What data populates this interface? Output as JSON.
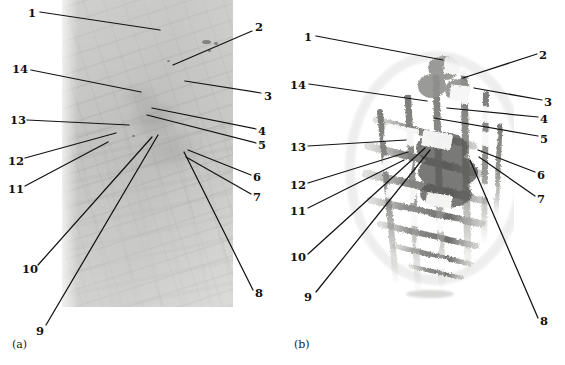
{
  "figure": {
    "type": "two-panel micrograph figure with numbered leader-line callouts",
    "background_color": "#ffffff",
    "ink_color": "#131313"
  },
  "panels": [
    {
      "id": "a",
      "caption": "(a)",
      "caption_pos": {
        "x": 12,
        "y": 338
      },
      "image": {
        "name": "micrograph-photo",
        "description": "grayscale light micrograph, rectangular frame",
        "bounds": {
          "x": 62,
          "y": 0,
          "w": 171,
          "h": 307
        },
        "base_color": "#c5c5c3",
        "white_notch": {
          "x": 200,
          "y": 228,
          "w": 28,
          "h": 20
        }
      },
      "labels": [
        {
          "text": "1",
          "x": 28,
          "y": 8,
          "anchor": "right",
          "line": {
            "x1": 40,
            "y1": 12,
            "x2": 160,
            "y2": 30
          }
        },
        {
          "text": "2",
          "x": 255,
          "y": 22,
          "anchor": "left",
          "line": {
            "x1": 252,
            "y1": 31,
            "x2": 173,
            "y2": 65
          }
        },
        {
          "text": "3",
          "x": 264,
          "y": 91,
          "anchor": "left",
          "line": {
            "x1": 261,
            "y1": 93,
            "x2": 185,
            "y2": 81
          }
        },
        {
          "text": "4",
          "x": 258,
          "y": 126,
          "anchor": "left",
          "line": {
            "x1": 256,
            "y1": 129,
            "x2": 152,
            "y2": 108
          }
        },
        {
          "text": "5",
          "x": 258,
          "y": 140,
          "anchor": "left",
          "line": {
            "x1": 256,
            "y1": 143,
            "x2": 147,
            "y2": 115
          }
        },
        {
          "text": "6",
          "x": 253,
          "y": 172,
          "anchor": "left",
          "line": {
            "x1": 251,
            "y1": 175,
            "x2": 188,
            "y2": 150
          }
        },
        {
          "text": "7",
          "x": 253,
          "y": 192,
          "anchor": "left",
          "line": {
            "x1": 251,
            "y1": 194,
            "x2": 186,
            "y2": 157
          }
        },
        {
          "text": "8",
          "x": 255,
          "y": 288,
          "anchor": "left",
          "line": {
            "x1": 253,
            "y1": 290,
            "x2": 184,
            "y2": 152
          }
        },
        {
          "text": "9",
          "x": 36,
          "y": 326,
          "anchor": "right",
          "line": {
            "x1": 46,
            "y1": 325,
            "x2": 158,
            "y2": 135
          }
        },
        {
          "text": "10",
          "x": 22,
          "y": 264,
          "anchor": "right",
          "line": {
            "x1": 38,
            "y1": 265,
            "x2": 152,
            "y2": 137
          }
        },
        {
          "text": "11",
          "x": 8,
          "y": 184,
          "anchor": "right",
          "line": {
            "x1": 25,
            "y1": 186,
            "x2": 108,
            "y2": 142
          }
        },
        {
          "text": "12",
          "x": 8,
          "y": 156,
          "anchor": "right",
          "line": {
            "x1": 25,
            "y1": 158,
            "x2": 116,
            "y2": 133
          }
        },
        {
          "text": "13",
          "x": 10,
          "y": 115,
          "anchor": "right",
          "line": {
            "x1": 27,
            "y1": 120,
            "x2": 129,
            "y2": 125
          }
        },
        {
          "text": "14",
          "x": 12,
          "y": 64,
          "anchor": "right",
          "line": {
            "x1": 31,
            "y1": 70,
            "x2": 141,
            "y2": 92
          }
        }
      ]
    },
    {
      "id": "b",
      "caption": "(b)",
      "caption_pos": {
        "x": 12,
        "y": 338
      },
      "image": {
        "name": "micrograph-mesh",
        "description": "segmented lattice / mesh skeleton extracted from micrograph (a)",
        "bounds": {
          "x": 42,
          "y": 28,
          "w": 190,
          "h": 275
        },
        "base_color": "#8f8f8d"
      },
      "labels": [
        {
          "text": "1",
          "x": 22,
          "y": 32,
          "anchor": "right",
          "line": {
            "x1": 34,
            "y1": 36,
            "x2": 161,
            "y2": 60
          }
        },
        {
          "text": "2",
          "x": 257,
          "y": 50,
          "anchor": "left",
          "line": {
            "x1": 255,
            "y1": 54,
            "x2": 181,
            "y2": 78
          }
        },
        {
          "text": "3",
          "x": 262,
          "y": 97,
          "anchor": "left",
          "line": {
            "x1": 260,
            "y1": 100,
            "x2": 192,
            "y2": 88
          }
        },
        {
          "text": "4",
          "x": 258,
          "y": 114,
          "anchor": "left",
          "line": {
            "x1": 256,
            "y1": 117,
            "x2": 165,
            "y2": 108
          }
        },
        {
          "text": "5",
          "x": 258,
          "y": 134,
          "anchor": "left",
          "line": {
            "x1": 256,
            "y1": 136,
            "x2": 152,
            "y2": 118
          }
        },
        {
          "text": "6",
          "x": 255,
          "y": 170,
          "anchor": "left",
          "line": {
            "x1": 253,
            "y1": 172,
            "x2": 196,
            "y2": 150
          }
        },
        {
          "text": "7",
          "x": 255,
          "y": 194,
          "anchor": "left",
          "line": {
            "x1": 253,
            "y1": 196,
            "x2": 197,
            "y2": 157
          }
        },
        {
          "text": "8",
          "x": 258,
          "y": 316,
          "anchor": "left",
          "line": {
            "x1": 256,
            "y1": 318,
            "x2": 188,
            "y2": 160
          }
        },
        {
          "text": "9",
          "x": 22,
          "y": 292,
          "anchor": "right",
          "line": {
            "x1": 34,
            "y1": 292,
            "x2": 148,
            "y2": 150
          }
        },
        {
          "text": "10",
          "x": 8,
          "y": 252,
          "anchor": "right",
          "line": {
            "x1": 26,
            "y1": 254,
            "x2": 143,
            "y2": 148
          }
        },
        {
          "text": "11",
          "x": 8,
          "y": 206,
          "anchor": "right",
          "line": {
            "x1": 26,
            "y1": 208,
            "x2": 122,
            "y2": 160
          }
        },
        {
          "text": "12",
          "x": 8,
          "y": 180,
          "anchor": "right",
          "line": {
            "x1": 26,
            "y1": 183,
            "x2": 126,
            "y2": 152
          }
        },
        {
          "text": "13",
          "x": 8,
          "y": 142,
          "anchor": "right",
          "line": {
            "x1": 26,
            "y1": 146,
            "x2": 124,
            "y2": 140
          }
        },
        {
          "text": "14",
          "x": 8,
          "y": 80,
          "anchor": "right",
          "line": {
            "x1": 27,
            "y1": 84,
            "x2": 145,
            "y2": 101
          }
        }
      ]
    }
  ]
}
